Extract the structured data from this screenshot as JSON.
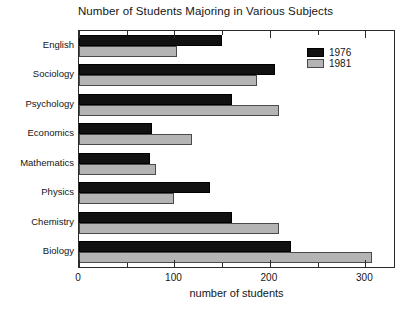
{
  "chart_data": {
    "type": "bar",
    "orientation": "horizontal",
    "title": "Number of Students Majoring in Various Subjects",
    "xlabel": "number of students",
    "ylabel": "",
    "xlim": [
      0,
      330
    ],
    "xticks": [
      0,
      100,
      200,
      300
    ],
    "xtick_labels": [
      "0",
      "100",
      "200",
      "300"
    ],
    "xticks_minor": [
      50,
      150,
      250
    ],
    "grid": false,
    "legend_position": "top-right",
    "categories": [
      "English",
      "Sociology",
      "Psychology",
      "Economics",
      "Mathematics",
      "Physics",
      "Chemistry",
      "Biology"
    ],
    "series": [
      {
        "name": "1976",
        "color": "#111111",
        "values": [
          150,
          205,
          160,
          76,
          74,
          137,
          160,
          222
        ]
      },
      {
        "name": "1981",
        "color": "#b4b4b4",
        "values": [
          103,
          186,
          210,
          118,
          81,
          99,
          210,
          307
        ]
      }
    ]
  }
}
